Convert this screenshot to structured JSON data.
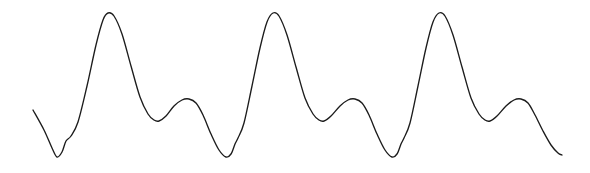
{
  "figure": {
    "kind": "waveform-plot",
    "width": 590,
    "height": 173,
    "background_color": "#ffffff",
    "axes_visible": false,
    "grid_visible": false,
    "labels_visible": false,
    "title": "",
    "caption": ""
  },
  "series": {
    "name": "waveform",
    "stroke_color": "#1c1c1c",
    "stroke_width": 1.35,
    "fill": "none",
    "line_style": "solid",
    "smoothing": "cubic-bezier"
  },
  "chart_data": {
    "type": "line",
    "title": "",
    "xlabel": "",
    "ylabel": "",
    "grid": false,
    "legend_position": "none",
    "xlim": [
      0,
      590
    ],
    "ylim": [
      173,
      0
    ],
    "axis_note": "pixel coordinates; y increases downward",
    "period_px": 166,
    "cycles": 3,
    "peak_y_px": 13,
    "trough_y_px": 158,
    "mid_valley_y_px": 121,
    "secondary_bump_y_px": 100,
    "shoulder_y_px": 140,
    "series": [
      {
        "name": "waveform",
        "points": [
          [
            33,
            110
          ],
          [
            44,
            130
          ],
          [
            52,
            148
          ],
          [
            57,
            157
          ],
          [
            62,
            152
          ],
          [
            66,
            141
          ],
          [
            71,
            136
          ],
          [
            78,
            122
          ],
          [
            87,
            86
          ],
          [
            96,
            45
          ],
          [
            103,
            20
          ],
          [
            108,
            13
          ],
          [
            114,
            16
          ],
          [
            122,
            34
          ],
          [
            131,
            66
          ],
          [
            140,
            97
          ],
          [
            148,
            114
          ],
          [
            154,
            120
          ],
          [
            159,
            121
          ],
          [
            166,
            116
          ],
          [
            174,
            106
          ],
          [
            182,
            100
          ],
          [
            189,
            99
          ],
          [
            196,
            103
          ],
          [
            203,
            115
          ],
          [
            211,
            134
          ],
          [
            219,
            150
          ],
          [
            226,
            157
          ],
          [
            231,
            154
          ],
          [
            235,
            144
          ],
          [
            238,
            138
          ],
          [
            244,
            123
          ],
          [
            252,
            86
          ],
          [
            260,
            48
          ],
          [
            267,
            22
          ],
          [
            273,
            13
          ],
          [
            279,
            16
          ],
          [
            287,
            35
          ],
          [
            296,
            67
          ],
          [
            305,
            98
          ],
          [
            313,
            114
          ],
          [
            319,
            120
          ],
          [
            324,
            121
          ],
          [
            331,
            116
          ],
          [
            340,
            106
          ],
          [
            348,
            100
          ],
          [
            355,
            99
          ],
          [
            362,
            103
          ],
          [
            369,
            115
          ],
          [
            377,
            134
          ],
          [
            385,
            150
          ],
          [
            392,
            157
          ],
          [
            397,
            154
          ],
          [
            401,
            144
          ],
          [
            404,
            138
          ],
          [
            410,
            123
          ],
          [
            418,
            86
          ],
          [
            426,
            48
          ],
          [
            433,
            22
          ],
          [
            439,
            13
          ],
          [
            445,
            16
          ],
          [
            453,
            35
          ],
          [
            462,
            67
          ],
          [
            471,
            98
          ],
          [
            479,
            114
          ],
          [
            485,
            120
          ],
          [
            490,
            121
          ],
          [
            497,
            116
          ],
          [
            506,
            106
          ],
          [
            514,
            100
          ],
          [
            521,
            99
          ],
          [
            528,
            103
          ],
          [
            535,
            115
          ],
          [
            543,
            131
          ],
          [
            551,
            145
          ],
          [
            558,
            153
          ],
          [
            562,
            155
          ]
        ]
      }
    ],
    "annotations": []
  }
}
